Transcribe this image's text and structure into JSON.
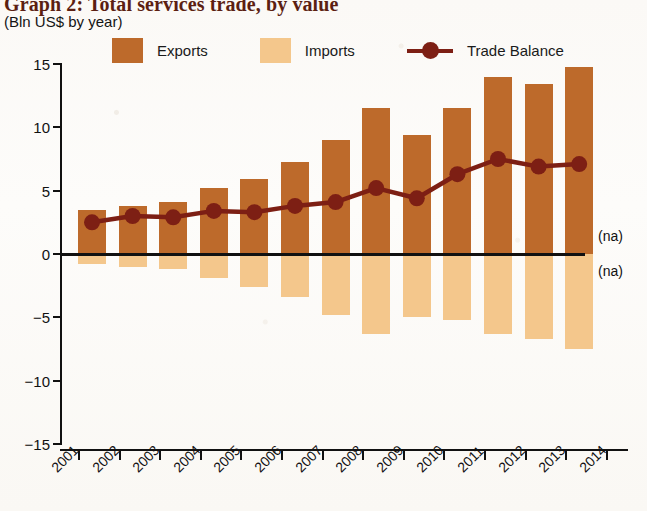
{
  "header": {
    "title": "Graph 2: Total services trade, by value",
    "subtitle": "(Bln US$ by year)"
  },
  "legend": {
    "items": [
      {
        "label": "Exports",
        "color": "#bd6a2b",
        "marker": "square"
      },
      {
        "label": "Imports",
        "color": "#f4c78c",
        "marker": "square"
      },
      {
        "label": "Trade Balance",
        "color": "#7d1f14",
        "marker": "line-dot"
      }
    ]
  },
  "annotations": [
    {
      "name": "na-exports",
      "text": "(na)"
    },
    {
      "name": "na-imports",
      "text": "(na)"
    }
  ],
  "chart_data": {
    "type": "bar",
    "title": "Graph 2: Total services trade, by value",
    "subtitle": "(Bln US$ by year)",
    "xlabel": "",
    "ylabel": "Bln US$ by year",
    "ylim": [
      -15,
      15
    ],
    "yticks": [
      15,
      10,
      5,
      0,
      -5,
      -10,
      -15
    ],
    "ytick_labels": [
      "15",
      "10",
      "5",
      "0",
      "−5",
      "−10",
      "−15"
    ],
    "grid": false,
    "legend_position": "top",
    "categories": [
      "2001",
      "2002",
      "2003",
      "2004",
      "2005",
      "2006",
      "2007",
      "2008",
      "2009",
      "2010",
      "2011",
      "2012",
      "2013",
      "2014"
    ],
    "series": [
      {
        "name": "Exports",
        "type": "bar",
        "color": "#bd6a2b",
        "values": [
          3.5,
          3.8,
          4.1,
          5.2,
          5.9,
          7.3,
          9.0,
          11.5,
          9.4,
          11.5,
          14.0,
          13.4,
          14.8,
          null
        ]
      },
      {
        "name": "Imports",
        "type": "bar",
        "color": "#f4c78c",
        "values": [
          -0.8,
          -1.0,
          -1.2,
          -1.9,
          -2.6,
          -3.4,
          -4.8,
          -6.3,
          -5.0,
          -5.2,
          -6.3,
          -6.7,
          -7.5,
          null
        ]
      },
      {
        "name": "Trade Balance",
        "type": "line",
        "color": "#7d1f14",
        "values": [
          2.5,
          3.0,
          2.9,
          3.4,
          3.3,
          3.8,
          4.1,
          5.2,
          4.4,
          6.3,
          7.5,
          6.9,
          7.1,
          null
        ]
      }
    ]
  }
}
